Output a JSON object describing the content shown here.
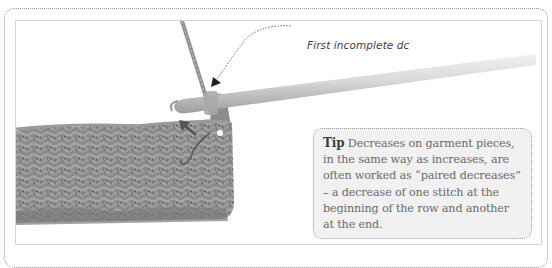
{
  "figure": {
    "callout": {
      "label": "First incomplete dc",
      "target": "crochet-hook-loop"
    },
    "tip": {
      "label": "Tip",
      "body": " Decreases on garment pieces, in the same way as increases, are often worked as “paired decreases” – a decrease of one stitch at the beginning of the row and another at the end."
    },
    "icons": {
      "arrow_left": "direction-arrow-icon",
      "callout_arrow": "callout-arrow-icon"
    },
    "colors": {
      "frame_border": "#9a9a9a",
      "tip_background": "#f1f1f1",
      "tip_text": "#6a6a6a",
      "tip_label": "#3d3d3d",
      "yarn": "#8c8c8c",
      "hook": "#cfcfcf"
    }
  }
}
